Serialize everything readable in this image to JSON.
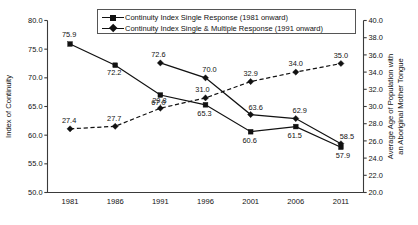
{
  "chart_data": {
    "type": "line",
    "title": "",
    "xlabel": "",
    "ylabel": "Index of Continuity",
    "y2label_line1": "Average Age of Population with",
    "y2label_line2": "an Aboriginal Mother Tongue",
    "categories": [
      "1981",
      "1986",
      "1991",
      "1996",
      "2001",
      "2006",
      "2011"
    ],
    "ylim": [
      50.0,
      80.0
    ],
    "y2lim": [
      20.0,
      40.0
    ],
    "yticks": [
      "50.0",
      "55.0",
      "60.0",
      "65.0",
      "70.0",
      "75.0",
      "80.0"
    ],
    "y2ticks": [
      "20.0",
      "22.0",
      "24.0",
      "26.0",
      "28.0",
      "30.0",
      "32.0",
      "34.0",
      "36.0",
      "38.0",
      "40.0"
    ],
    "grid": false,
    "legend_position": "top-center",
    "series": [
      {
        "name": "Continuity Index Single Response (1981 onward)",
        "marker": "square",
        "linestyle": "solid",
        "axis": "left",
        "x": [
          "1981",
          "1986",
          "1991",
          "1996",
          "2001",
          "2006",
          "2011"
        ],
        "values": [
          75.9,
          72.2,
          67.0,
          65.3,
          60.6,
          61.5,
          57.9
        ],
        "labels": [
          "75.9",
          "72.2",
          "67.0",
          "65.3",
          "60.6",
          "61.5",
          "57.9"
        ]
      },
      {
        "name": "Continuity Index Single & Multiple Response (1991 onward)",
        "marker": "diamond",
        "linestyle": "solid",
        "axis": "left",
        "x": [
          "1991",
          "1996",
          "2001",
          "2006",
          "2011"
        ],
        "values": [
          72.6,
          70.0,
          63.6,
          62.9,
          58.5
        ],
        "labels": [
          "72.6",
          "70.0",
          "63.6",
          "62.9",
          "58.5"
        ]
      },
      {
        "name": "Average Age of Population with an Aboriginal Mother Tongue",
        "marker": "diamond",
        "linestyle": "dashed",
        "axis": "right",
        "x": [
          "1981",
          "1986",
          "1991",
          "1996",
          "2001",
          "2006",
          "2011"
        ],
        "values": [
          27.4,
          27.7,
          29.8,
          31.0,
          32.9,
          34.0,
          35.0
        ],
        "labels": [
          "27.4",
          "27.7",
          "29.8",
          "31.0",
          "32.9",
          "34.0",
          "35.0"
        ]
      }
    ]
  },
  "legend": {
    "items": [
      {
        "label": "Continuity Index Single Response (1981 onward)",
        "marker": "square"
      },
      {
        "label": "Continuity Index Single & Multiple Response (1991 onward)",
        "marker": "diamond"
      }
    ]
  },
  "colors": {
    "series": "#111111",
    "axis": "#3a3a3a",
    "background": "#ffffff"
  }
}
